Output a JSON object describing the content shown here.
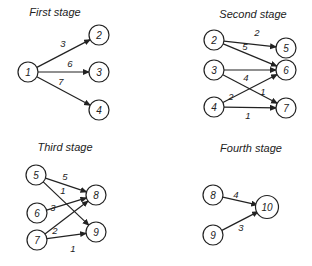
{
  "stages": [
    {
      "title": "First stage",
      "title_pos": [
        55,
        16
      ],
      "nodes": [
        {
          "id": "1",
          "x": 28,
          "y": 72
        },
        {
          "id": "2",
          "x": 99,
          "y": 35
        },
        {
          "id": "3",
          "x": 99,
          "y": 72
        },
        {
          "id": "4",
          "x": 99,
          "y": 110
        }
      ],
      "edges": [
        {
          "from": "1",
          "to": "2",
          "weight": "3",
          "label_pos": [
            63,
            47
          ]
        },
        {
          "from": "1",
          "to": "3",
          "weight": "6",
          "label_pos": [
            70,
            67
          ]
        },
        {
          "from": "1",
          "to": "4",
          "weight": "7",
          "label_pos": [
            61,
            85
          ]
        }
      ]
    },
    {
      "title": "Second stage",
      "title_pos": [
        253,
        18
      ],
      "nodes": [
        {
          "id": "2",
          "x": 214,
          "y": 40
        },
        {
          "id": "5",
          "x": 286,
          "y": 48
        },
        {
          "id": "3",
          "x": 214,
          "y": 70
        },
        {
          "id": "6",
          "x": 286,
          "y": 70
        },
        {
          "id": "4",
          "x": 214,
          "y": 107
        },
        {
          "id": "7",
          "x": 286,
          "y": 108
        }
      ],
      "edges": [
        {
          "from": "2",
          "to": "5",
          "weight": "2",
          "label_pos": [
            257,
            36
          ],
          "straight_to": [
            284,
            37
          ]
        },
        {
          "from": "2",
          "to": "6",
          "weight": "5",
          "label_pos": [
            245,
            50
          ]
        },
        {
          "from": "3",
          "to": "6",
          "weight": "4",
          "label_pos": [
            246,
            81
          ]
        },
        {
          "from": "3",
          "to": "7",
          "weight": "1",
          "label_pos": [
            263,
            95
          ]
        },
        {
          "from": "4",
          "to": "6",
          "weight": "2",
          "label_pos": [
            231,
            100
          ]
        },
        {
          "from": "4",
          "to": "7",
          "weight": "1",
          "label_pos": [
            248,
            119
          ]
        }
      ]
    },
    {
      "title": "Third stage",
      "title_pos": [
        65,
        151
      ],
      "nodes": [
        {
          "id": "5",
          "x": 36,
          "y": 175
        },
        {
          "id": "6",
          "x": 37,
          "y": 213
        },
        {
          "id": "7",
          "x": 37,
          "y": 240
        },
        {
          "id": "8",
          "x": 96,
          "y": 195
        },
        {
          "id": "9",
          "x": 96,
          "y": 232
        }
      ],
      "edges": [
        {
          "from": "5",
          "to": "8",
          "weight": "5",
          "label_pos": [
            65,
            180
          ]
        },
        {
          "from": "5",
          "to": "9",
          "weight": "1",
          "label_pos": [
            63,
            194
          ]
        },
        {
          "from": "6",
          "to": "8",
          "weight": "3",
          "label_pos": [
            53,
            211
          ]
        },
        {
          "from": "7",
          "to": "8",
          "weight": "2",
          "label_pos": [
            55,
            234
          ]
        },
        {
          "from": "7",
          "to": "9",
          "weight": "1",
          "label_pos": [
            73,
            252
          ]
        }
      ]
    },
    {
      "title": "Fourth stage",
      "title_pos": [
        251,
        152
      ],
      "nodes": [
        {
          "id": "8",
          "x": 213,
          "y": 195
        },
        {
          "id": "9",
          "x": 213,
          "y": 235
        },
        {
          "id": "10",
          "x": 267,
          "y": 207
        }
      ],
      "edges": [
        {
          "from": "8",
          "to": "10",
          "weight": "4",
          "label_pos": [
            236,
            198
          ]
        },
        {
          "from": "9",
          "to": "10",
          "weight": "3",
          "label_pos": [
            241,
            231
          ]
        }
      ]
    }
  ],
  "style": {
    "stroke": "#222222",
    "background": "#ffffff",
    "node_radius": 10
  }
}
